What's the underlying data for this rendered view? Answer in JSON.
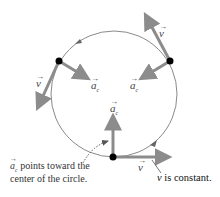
{
  "diagram": {
    "type": "uniform-circular-motion",
    "colors": {
      "circle": "#8a8a8a",
      "vector": "#8c8c8c",
      "dot": "#000000",
      "text": "#333333"
    },
    "labels": {
      "v": "v",
      "ac": "a",
      "ac_sub": "c",
      "arrow_over": "→"
    },
    "annotations": {
      "ac_note_prefix": "a",
      "ac_note_sub": "c",
      "ac_note_line1": " points toward the",
      "ac_note_line2": "center of the circle.",
      "v_note_italic": "v",
      "v_note_rest": " is constant."
    },
    "points": [
      {
        "name": "top-right",
        "x": 170,
        "y": 61
      },
      {
        "name": "left",
        "x": 59,
        "y": 61
      },
      {
        "name": "bottom",
        "x": 113,
        "y": 157
      }
    ]
  }
}
